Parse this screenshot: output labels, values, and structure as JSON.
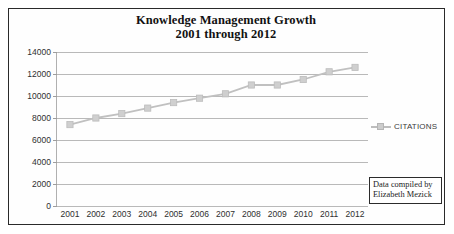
{
  "chart_data": {
    "type": "line",
    "title": "Knowledge Management Growth",
    "subtitle": "2001 through 2012",
    "xlabel": "",
    "ylabel": "",
    "categories": [
      "2001",
      "2002",
      "2003",
      "2004",
      "2005",
      "2006",
      "2007",
      "2008",
      "2009",
      "2010",
      "2011",
      "2012"
    ],
    "series": [
      {
        "name": "CITATIONS",
        "values": [
          7400,
          8000,
          8400,
          8900,
          9400,
          9800,
          10200,
          11000,
          11000,
          11500,
          12200,
          12600
        ],
        "color": "#c0c0c0",
        "marker": "square"
      }
    ],
    "ylim": [
      0,
      14000
    ],
    "yticks": [
      0,
      2000,
      4000,
      6000,
      8000,
      10000,
      12000,
      14000
    ],
    "ytick_labels": [
      "0",
      "2000",
      "4000",
      "6000",
      "8000",
      "10000",
      "12000",
      "14000"
    ],
    "grid": true,
    "legend_position": "right",
    "legend_entries": [
      "CITATIONS"
    ]
  },
  "annotation": {
    "line1": "Data compiled by",
    "line2": "Elizabeth Mezick"
  }
}
